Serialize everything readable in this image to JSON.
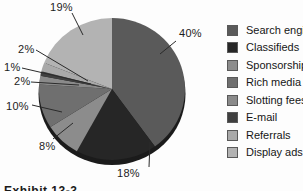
{
  "caption": "Exhibit 13-3",
  "chart_data": {
    "type": "pie",
    "title": "",
    "legend_position": "right",
    "start_angle_deg": 0,
    "direction": "clockwise",
    "background": "#fdfdfd",
    "shadow_color": "#1b1b1b",
    "slices": [
      {
        "label": "Search engine",
        "value": 40,
        "pct_label": "40%",
        "color": "#5a5a5a"
      },
      {
        "label": "Classifieds",
        "value": 18,
        "pct_label": "18%",
        "color": "#262626"
      },
      {
        "label": "Sponsorship",
        "value": 8,
        "pct_label": "8%",
        "color": "#8c8c8c"
      },
      {
        "label": "Rich media",
        "value": 10,
        "pct_label": "10%",
        "color": "#6f6f6f"
      },
      {
        "label": "Slotting fees",
        "value": 2,
        "pct_label": "2%",
        "color": "#8a8a8a"
      },
      {
        "label": "E-mail",
        "value": 1,
        "pct_label": "1%",
        "color": "#3f3f3f"
      },
      {
        "label": "Referrals",
        "value": 2,
        "pct_label": "2%",
        "color": "#a9a9a9"
      },
      {
        "label": "Display ads",
        "value": 19,
        "pct_label": "19%",
        "color": "#b3b3b3"
      }
    ]
  }
}
